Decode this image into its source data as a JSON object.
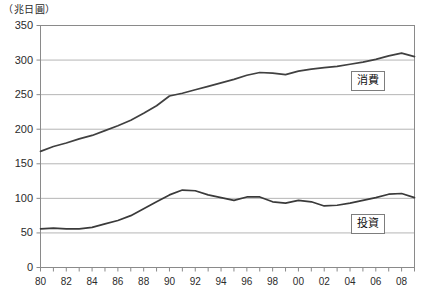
{
  "chart_data": {
    "type": "line",
    "title": "",
    "subtitle": "",
    "unit_label": "（兆日圓）",
    "xlabel": "",
    "ylabel": "",
    "ylim": [
      0,
      350
    ],
    "xlim": [
      1980,
      2009
    ],
    "grid": true,
    "grid_axis": "y",
    "legend_position": "inside-right",
    "y_ticks": [
      0,
      50,
      100,
      150,
      200,
      250,
      300,
      350
    ],
    "y_tick_labels": [
      "0",
      "50",
      "100",
      "150",
      "200",
      "250",
      "300",
      "350"
    ],
    "x_tick_values": [
      1980,
      1982,
      1984,
      1986,
      1988,
      1990,
      1992,
      1994,
      1996,
      1998,
      2000,
      2002,
      2004,
      2006,
      2008
    ],
    "x_tick_labels": [
      "80",
      "82",
      "84",
      "86",
      "88",
      "90",
      "92",
      "94",
      "96",
      "98",
      "00",
      "02",
      "04",
      "06",
      "08"
    ],
    "x": [
      1980,
      1981,
      1982,
      1983,
      1984,
      1985,
      1986,
      1987,
      1988,
      1989,
      1990,
      1991,
      1992,
      1993,
      1994,
      1995,
      1996,
      1997,
      1998,
      1999,
      2000,
      2001,
      2002,
      2003,
      2004,
      2005,
      2006,
      2007,
      2008,
      2009
    ],
    "series": [
      {
        "name": "消費",
        "label": "消費",
        "color": "#404040",
        "values": [
          168,
          175,
          180,
          186,
          191,
          198,
          205,
          213,
          223,
          234,
          248,
          252,
          257,
          262,
          267,
          272,
          278,
          282,
          281,
          279,
          284,
          287,
          289,
          291,
          294,
          297,
          301,
          306,
          310,
          305
        ]
      },
      {
        "name": "投資",
        "label": "投資",
        "color": "#3a3a3a",
        "values": [
          56,
          57,
          56,
          56,
          58,
          63,
          68,
          75,
          85,
          95,
          105,
          112,
          111,
          105,
          101,
          97,
          102,
          102,
          95,
          93,
          97,
          95,
          89,
          90,
          93,
          97,
          101,
          106,
          107,
          101
        ]
      }
    ]
  },
  "axes": {
    "frame_color": "#8a8a8a",
    "gridline_color": "#b5b5b5"
  }
}
